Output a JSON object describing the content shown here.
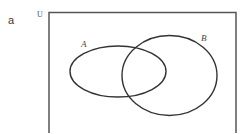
{
  "figure": {
    "part_label": "a",
    "universe": {
      "label": "U"
    },
    "sets": [
      {
        "name": "set-a",
        "label": "A"
      },
      {
        "name": "set-b",
        "label": "B"
      }
    ]
  }
}
